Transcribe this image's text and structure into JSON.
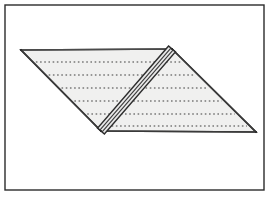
{
  "figure": {
    "canvas": {
      "width": 274,
      "height": 198,
      "background": "#ffffff"
    },
    "frame": {
      "name": "outer-border",
      "x": 5,
      "y": 5,
      "width": 259,
      "height": 185,
      "stroke": "#2b2b2b",
      "stroke_width": 1.4,
      "fill": "none"
    },
    "plane": {
      "name": "parallelogram-plane",
      "points": "21,50 172,49 256,132 101,131",
      "fill": "#f0f0ef",
      "stroke": "#3a3a3a",
      "stroke_width": 1.6
    },
    "plane_edges": [
      {
        "name": "top-edge",
        "x1": 21,
        "y1": 50,
        "x2": 172,
        "y2": 49,
        "stroke": "#4a4a4a",
        "stroke_width": 1.3
      },
      {
        "name": "right-edge",
        "x1": 172,
        "y1": 49,
        "x2": 256,
        "y2": 132,
        "stroke": "#3a3a3a",
        "stroke_width": 1.6
      },
      {
        "name": "bottom-edge",
        "x1": 256,
        "y1": 132,
        "x2": 101,
        "y2": 131,
        "stroke": "#3a3a3a",
        "stroke_width": 1.5
      },
      {
        "name": "left-edge",
        "x1": 101,
        "y1": 131,
        "x2": 21,
        "y2": 50,
        "stroke": "#3a3a3a",
        "stroke_width": 1.7
      }
    ],
    "hatch_lines": {
      "name": "dotted-contour-lines",
      "count": 6,
      "stroke": "#3d3d3d",
      "stroke_width": 1.1,
      "dash_pattern": "1.6 2.6",
      "rows_y": [
        62,
        75,
        88,
        101,
        114,
        126
      ]
    },
    "band": {
      "name": "diagonal-strip",
      "top_x": 172,
      "top_y": 49,
      "bottom_x": 101,
      "bottom_y": 131,
      "width": 9,
      "fill": "#e8e8e8",
      "stroke": "#2e2e2e",
      "stroke_width": 1.5,
      "inner_lines": 2,
      "inner_stroke": "#3a3a3a",
      "inner_stroke_width": 1.1
    },
    "vertices": [
      {
        "name": "vertex-top-left",
        "x": 21,
        "y": 50
      },
      {
        "name": "vertex-top-right",
        "x": 172,
        "y": 49
      },
      {
        "name": "vertex-bottom-right",
        "x": 256,
        "y": 132
      },
      {
        "name": "vertex-bottom-left",
        "x": 101,
        "y": 131
      }
    ]
  }
}
